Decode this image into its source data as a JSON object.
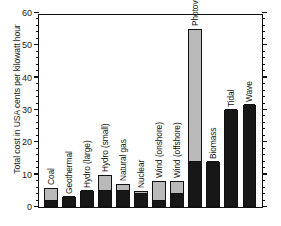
{
  "chart_data": {
    "type": "bar",
    "title": "",
    "subtitle": "",
    "xlabel": "",
    "ylabel": "Total cost in USA cents per kilowatt hour",
    "ylim": [
      0,
      60
    ],
    "ytick_labels": [
      "0",
      "10",
      "20",
      "30",
      "40",
      "50",
      "60"
    ],
    "ytick_values": [
      0,
      10,
      20,
      30,
      40,
      50,
      60
    ],
    "minor_tick_step": 2,
    "grid": false,
    "legend": "none",
    "stacked": true,
    "series": [
      {
        "name": "lower (dark) segment",
        "color": "#171717",
        "values": [
          2,
          3,
          5,
          5,
          5,
          4,
          2,
          4,
          14,
          14,
          30,
          31.5
        ]
      },
      {
        "name": "upper (light) segment",
        "color": "#b9b9b9",
        "values": [
          4,
          0,
          0,
          5,
          2,
          1,
          6,
          4,
          41,
          0,
          0,
          0
        ]
      }
    ],
    "categories": [
      "Coal",
      "Geothermal",
      "Hydro (large)",
      "Hydro (small)",
      "Natural gas",
      "Nuclear",
      "Wind (onshore)",
      "Wind (offshore)",
      "Photovoltaic solar",
      "Biomass",
      "Tidal",
      "Wave"
    ],
    "totals": [
      6,
      3,
      5,
      10,
      7,
      5,
      8,
      8,
      55,
      14,
      30,
      31.5
    ]
  },
  "colors": {
    "axis": "#111111",
    "dark_segment": "#171717",
    "light_segment": "#b9b9b9",
    "background": "#ffffff"
  }
}
